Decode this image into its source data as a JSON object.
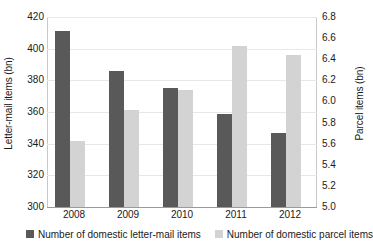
{
  "chart_data": {
    "type": "bar",
    "title": "",
    "xlabel": "",
    "categories": [
      "2008",
      "2009",
      "2010",
      "2011",
      "2012"
    ],
    "grid": true,
    "legend_position": "bottom",
    "axes": {
      "left": {
        "label": "Letter-mail items (bn)",
        "ylim": [
          300,
          420
        ],
        "ticks": [
          420,
          400,
          380,
          360,
          340,
          320,
          300
        ],
        "tick_labels": [
          "420",
          "400",
          "380",
          "360",
          "340",
          "320",
          "300"
        ]
      },
      "right": {
        "label": "Parcel items (bn)",
        "ylim": [
          5.0,
          6.8
        ],
        "ticks": [
          6.8,
          6.6,
          6.4,
          6.2,
          6.0,
          5.8,
          5.6,
          5.4,
          5.2,
          5.0
        ],
        "tick_labels": [
          "6.8",
          "6.6",
          "6.4",
          "6.2",
          "6.0",
          "5.8",
          "5.6",
          "5.4",
          "5.2",
          "5.0"
        ]
      }
    },
    "series": [
      {
        "name": "Number of domestic letter-mail items",
        "axis": "left",
        "color": "#595959",
        "values": [
          411,
          386,
          375,
          359,
          347
        ]
      },
      {
        "name": "Number of domestic parcel items",
        "axis": "right",
        "color": "#d3d3d3",
        "values": [
          5.63,
          5.92,
          6.11,
          6.53,
          6.44
        ]
      }
    ]
  },
  "legend": {
    "entries": [
      {
        "label": "Number of domestic letter-mail items",
        "swatch": "letter"
      },
      {
        "label": "Number of domestic parcel items",
        "swatch": "parcel"
      }
    ]
  }
}
